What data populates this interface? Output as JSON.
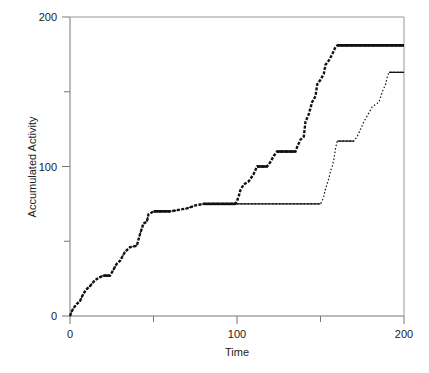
{
  "chart_data": {
    "type": "line",
    "title": "",
    "xlabel": "Time",
    "ylabel": "Accumulated Activity",
    "xlim": [
      0,
      200
    ],
    "ylim": [
      0,
      200
    ],
    "xticks": [
      0,
      100,
      200
    ],
    "xticks_minor": [
      50,
      150
    ],
    "yticks": [
      0,
      100,
      200
    ],
    "yticks_minor": [
      50,
      150
    ],
    "grid": false,
    "legend": null,
    "series": [
      {
        "name": "series-1",
        "style": "thick-dots",
        "x": [
          0,
          1,
          2,
          4,
          6,
          8,
          10,
          12,
          15,
          18,
          20,
          24,
          28,
          30,
          33,
          36,
          40,
          42,
          44,
          46,
          47,
          50,
          60,
          65,
          70,
          75,
          80,
          90,
          99,
          100,
          101,
          102,
          104,
          107,
          110,
          112,
          118,
          120,
          122,
          124,
          135,
          136,
          138,
          140,
          141,
          143,
          145,
          147,
          148,
          150,
          152,
          153,
          155,
          157,
          159,
          160,
          200
        ],
        "values": [
          0,
          3,
          5,
          8,
          10,
          15,
          18,
          20,
          24,
          26,
          27,
          27,
          35,
          37,
          43,
          46,
          47,
          55,
          62,
          63,
          68,
          70,
          70,
          71,
          72,
          74,
          75,
          75,
          75,
          77,
          80,
          84,
          88,
          90,
          95,
          100,
          100,
          103,
          107,
          110,
          110,
          113,
          118,
          120,
          130,
          135,
          143,
          147,
          155,
          158,
          162,
          168,
          171,
          175,
          180,
          181,
          181
        ]
      },
      {
        "name": "series-2",
        "style": "thin-dots",
        "x": [
          0,
          1,
          2,
          4,
          6,
          8,
          10,
          12,
          15,
          18,
          20,
          24,
          28,
          30,
          33,
          36,
          40,
          42,
          44,
          46,
          47,
          50,
          60,
          65,
          70,
          75,
          80,
          90,
          99,
          150,
          151,
          152,
          153,
          155,
          156,
          157,
          158,
          159,
          160,
          170,
          172,
          174,
          176,
          178,
          181,
          185,
          187,
          189,
          190,
          191,
          200
        ],
        "values": [
          0,
          3,
          5,
          8,
          10,
          15,
          18,
          20,
          24,
          26,
          27,
          27,
          35,
          37,
          43,
          46,
          47,
          55,
          62,
          63,
          68,
          70,
          70,
          71,
          72,
          74,
          75,
          75,
          75,
          75,
          77,
          80,
          85,
          92,
          97,
          100,
          105,
          112,
          117,
          117,
          120,
          125,
          130,
          134,
          140,
          143,
          150,
          155,
          160,
          163,
          163
        ]
      }
    ]
  }
}
